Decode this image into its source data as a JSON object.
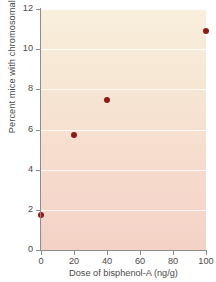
{
  "chart_data": {
    "type": "scatter",
    "title": "",
    "xlabel": "Dose of bisphenol-A (ng/g)",
    "ylabel": "Percent mice with chromosomal problems",
    "x": [
      0,
      20,
      40,
      100
    ],
    "values": [
      1.75,
      5.75,
      7.45,
      10.9
    ],
    "points": [
      {
        "x": 0,
        "y": 1.75
      },
      {
        "x": 20,
        "y": 5.75
      },
      {
        "x": 40,
        "y": 7.45
      },
      {
        "x": 100,
        "y": 10.9
      }
    ],
    "xlim": [
      0,
      100
    ],
    "ylim": [
      0,
      12
    ],
    "xticks": [
      "0",
      "20",
      "40",
      "60",
      "80",
      "100"
    ],
    "xtick_values": [
      0,
      20,
      40,
      60,
      80,
      100
    ],
    "yticks": [
      "0",
      "2",
      "4",
      "6",
      "8",
      "10",
      "12"
    ],
    "ytick_values": [
      0,
      2,
      4,
      6,
      8,
      10,
      12
    ],
    "grid": "horizontal",
    "legend": "none",
    "marker_color": "#8d1a19",
    "plot_bg_top_color": "#f8efdc",
    "plot_bg_bottom_color": "#f4d2c6",
    "axis_color": "#8d8d8d",
    "text_color": "#4a4a4a",
    "gridline_color": "#ffffff"
  }
}
